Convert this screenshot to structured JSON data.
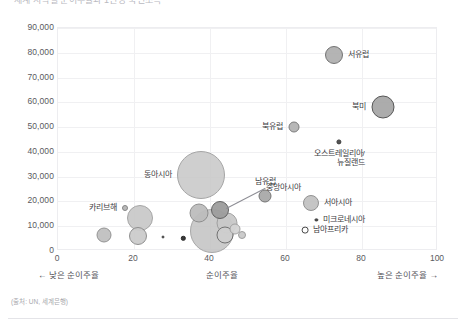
{
  "title": "세계 지역별 순이주율과 1인당 국민소득",
  "source": "(출처: UN, 세계은행)",
  "axis": {
    "y_ticks": [
      "0",
      "10,000",
      "20,000",
      "30,000",
      "40,000",
      "50,000",
      "60,000",
      "70,000",
      "80,000",
      "90,000"
    ],
    "x_ticks": [
      "0",
      "20",
      "40",
      "60",
      "80",
      "100"
    ],
    "caption_low": "←  낮은 순이주율",
    "caption_mid": "순이주율",
    "caption_high": "높은 순이주율  →"
  },
  "chart_data": {
    "type": "scatter",
    "title": "세계 지역별 순이주율과 1인당 국민소득",
    "xlabel": "순이주율",
    "ylabel": "",
    "xlim": [
      0,
      100
    ],
    "ylim": [
      0,
      90000
    ],
    "xticks": [
      0,
      20,
      40,
      60,
      80,
      100
    ],
    "yticks": [
      0,
      10000,
      20000,
      30000,
      40000,
      50000,
      60000,
      70000,
      80000,
      90000
    ],
    "grid": true,
    "legend": "none",
    "size_encodes": "인구 규모",
    "points": [
      {
        "label": "서유럽",
        "x": 72.5,
        "y": 79000,
        "r": 9,
        "fill": "#b0b0b0",
        "stroke": "#6d6d6d",
        "label_pos": "right"
      },
      {
        "label": "북미",
        "x": 85.5,
        "y": 58000,
        "r": 11.5,
        "fill": "#a8a8a8",
        "stroke": "#4f4f4f",
        "label_pos": "left"
      },
      {
        "label": "북유럽",
        "x": 62.0,
        "y": 50000,
        "r": 5.5,
        "fill": "#b4b4b4",
        "stroke": "#777777",
        "label_pos": "left"
      },
      {
        "label": "오스트레일리아/\n뉴질랜드",
        "x": 74.0,
        "y": 44000,
        "r": 2.6,
        "fill": "#4a4a4a",
        "stroke": "#333333",
        "label_pos": "below"
      },
      {
        "label": "동아시아",
        "x": 37.5,
        "y": 30500,
        "r": 24,
        "fill": "#c9c9c9",
        "stroke": "#9a9a9a",
        "label_pos": "left"
      },
      {
        "label": "남유럽",
        "x": 54.5,
        "y": 22000,
        "r": 6.5,
        "fill": "#a9a9a9",
        "stroke": "#6f6f6f",
        "label_pos": "above"
      },
      {
        "label": "서아시아",
        "x": 66.5,
        "y": 19500,
        "r": 8,
        "fill": "#c2c2c2",
        "stroke": "#8d8d8d",
        "label_pos": "right"
      },
      {
        "label": "미크로네시아",
        "x": 68.0,
        "y": 12500,
        "r": 1.6,
        "fill": "#4a4a4a",
        "stroke": "#333333",
        "label_pos": "right"
      },
      {
        "label": "남아프리카",
        "x": 65.0,
        "y": 8500,
        "r": 3.4,
        "fill": "#ffffff",
        "stroke": "#3d3d3d",
        "label_pos": "right"
      },
      {
        "label": "중앙아시아",
        "x": 42.5,
        "y": 16500,
        "r": 9,
        "fill": "#9d9d9d",
        "stroke": "#5d5d5d",
        "label_pos": "leader"
      },
      {
        "label": "카리브해",
        "x": 17.5,
        "y": 17500,
        "r": 3.0,
        "fill": "#b6b6b6",
        "stroke": "#808080",
        "label_pos": "left"
      },
      {
        "label": "",
        "x": 21.5,
        "y": 13500,
        "r": 13,
        "fill": "#c6c6c6",
        "stroke": "#9a9a9a",
        "label_pos": "none"
      },
      {
        "label": "",
        "x": 12.0,
        "y": 6500,
        "r": 7.5,
        "fill": "#c0c0c0",
        "stroke": "#8e8e8e",
        "label_pos": "none"
      },
      {
        "label": "",
        "x": 21.0,
        "y": 6000,
        "r": 9,
        "fill": "#cccccc",
        "stroke": "#8a8a8a",
        "label_pos": "none"
      },
      {
        "label": "",
        "x": 27.5,
        "y": 5500,
        "r": 1.5,
        "fill": "#555555",
        "stroke": "#3a3a3a",
        "label_pos": "none"
      },
      {
        "label": "",
        "x": 33.0,
        "y": 5200,
        "r": 2.2,
        "fill": "#2f2f2f",
        "stroke": "#1f1f1f",
        "label_pos": "none"
      },
      {
        "label": "",
        "x": 40.5,
        "y": 8000,
        "r": 22,
        "fill": "#c4c4c4",
        "stroke": "#9d9d9d",
        "label_pos": "none"
      },
      {
        "label": "",
        "x": 37.0,
        "y": 15500,
        "r": 9.5,
        "fill": "#bdbdbd",
        "stroke": "#8b8b8b",
        "label_pos": "none"
      },
      {
        "label": "",
        "x": 44.5,
        "y": 11500,
        "r": 10.5,
        "fill": "#c9c9c9",
        "stroke": "#9e9e9e",
        "label_pos": "none"
      },
      {
        "label": "",
        "x": 44.0,
        "y": 6500,
        "r": 8.5,
        "fill": "#cfcfcf",
        "stroke": "#6e6e6e",
        "label_pos": "none"
      },
      {
        "label": "",
        "x": 46.5,
        "y": 9000,
        "r": 5.5,
        "fill": "#d4d4d4",
        "stroke": "#a0a0a0",
        "label_pos": "none"
      },
      {
        "label": "",
        "x": 48.5,
        "y": 6500,
        "r": 4.0,
        "fill": "#cacaca",
        "stroke": "#9a9a9a",
        "label_pos": "none"
      }
    ]
  }
}
